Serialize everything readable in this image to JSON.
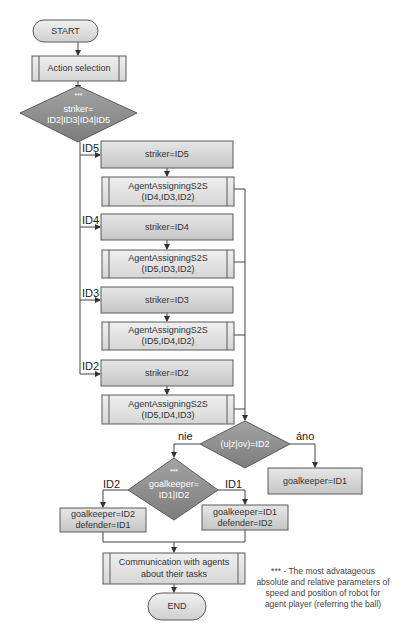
{
  "diagram": {
    "type": "flowchart",
    "nodes": {
      "start": {
        "label": "START"
      },
      "action_selection": {
        "label": "Action selection"
      },
      "striker_decision": {
        "marker": "***",
        "line1": "striker=",
        "line2": "ID2|ID3|ID4|ID5"
      },
      "striker_id5": {
        "label": "striker=ID5"
      },
      "assign_id5": {
        "line1": "AgentAssigningS2S",
        "line2": "(ID4,ID3,ID2)"
      },
      "striker_id4": {
        "label": "striker=ID4"
      },
      "assign_id4": {
        "line1": "AgentAssigningS2S",
        "line2": "(ID5,ID3,ID2)"
      },
      "striker_id3": {
        "label": "striker=ID3"
      },
      "assign_id3": {
        "line1": "AgentAssigningS2S",
        "line2": "(ID5,ID4,ID2)"
      },
      "striker_id2": {
        "label": "striker=ID2"
      },
      "assign_id2": {
        "line1": "AgentAssigningS2S",
        "line2": "(ID5,ID4,ID3)"
      },
      "uzov_decision": {
        "label": "(u|z|ov)=ID2"
      },
      "goalkeeper_id1_direct": {
        "label": "goalkeeper=ID1"
      },
      "goalkeeper_decision": {
        "marker": "***",
        "line1": "goalkeeper=",
        "line2": "ID1|ID2"
      },
      "gk_id2_box": {
        "line1": "goalkeeper=ID2",
        "line2": "defender=ID1"
      },
      "gk_id1_box": {
        "line1": "goalkeeper=ID1",
        "line2": "defender=ID2"
      },
      "communication": {
        "line1": "Communication with agents",
        "line2": "about their tasks"
      },
      "end": {
        "label": "END"
      }
    },
    "edge_labels": {
      "id5": "ID5",
      "id4": "ID4",
      "id3": "ID3",
      "id2": "ID2",
      "no": "nie",
      "yes": "áno",
      "gk_id2": "ID2",
      "gk_id1": "ID1"
    },
    "footnote": {
      "line1": "*** - The most advatageous",
      "line2": "absolute and relative parameters of",
      "line3": "speed and position of robot for",
      "line4": "agent player (referring the ball)"
    },
    "colors": {
      "process_fill": "#d4d4d4",
      "subprocess_fill": "#e2e2e2",
      "decision_fill": "#8c8c8c",
      "terminal_fill": "#dcdcdc",
      "stroke": "#5a5a5a",
      "line": "#444444"
    }
  }
}
